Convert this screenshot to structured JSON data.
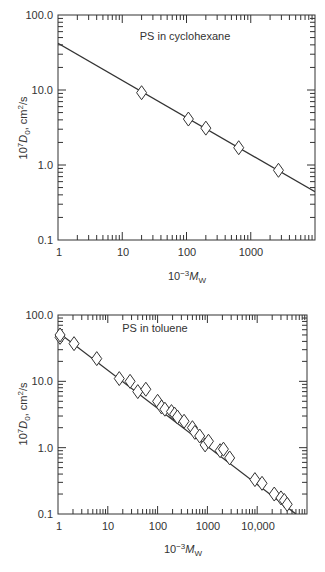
{
  "chart_data": [
    {
      "type": "scatter",
      "title": "PS in cyclohexane",
      "xlabel": "10^-3 M_W",
      "ylabel": "10^7 D_0, cm^2/s",
      "xscale": "log",
      "yscale": "log",
      "xlim": [
        1,
        10000
      ],
      "ylim": [
        0.1,
        100
      ],
      "x_ticks": [
        "1",
        "10",
        "100",
        "1000"
      ],
      "y_ticks": [
        "0.1",
        "1.0",
        "10.0",
        "100.0"
      ],
      "grid": false,
      "series": [
        {
          "name": "data",
          "marker": "diamond",
          "x": [
            20,
            107,
            200,
            650,
            2700
          ],
          "y": [
            9.2,
            4.1,
            3.1,
            1.7,
            0.85
          ]
        },
        {
          "name": "fit",
          "type": "line",
          "x": [
            1,
            10000
          ],
          "y": [
            42,
            0.44
          ]
        }
      ]
    },
    {
      "type": "scatter",
      "title": "PS in toluene",
      "xlabel": "10^-3 M_W",
      "ylabel": "10^7 D_0, cm^2/s",
      "xscale": "log",
      "yscale": "log",
      "xlim": [
        1,
        100000
      ],
      "ylim": [
        0.1,
        100
      ],
      "x_ticks": [
        "1",
        "10",
        "100",
        "1000",
        "10,000"
      ],
      "y_ticks": [
        "0.1",
        "1.0",
        "10.0",
        "100.0"
      ],
      "grid": false,
      "series": [
        {
          "name": "data",
          "marker": "diamond",
          "x": [
            1.1,
            1.1,
            2.1,
            6,
            17,
            28,
            40,
            58,
            100,
            120,
            140,
            190,
            220,
            250,
            340,
            500,
            560,
            700,
            900,
            1050,
            1800,
            2100,
            2800,
            9000,
            12500,
            22000,
            30000,
            35000,
            40000
          ],
          "y": [
            46,
            50,
            37,
            22,
            11,
            10,
            7,
            7.6,
            5,
            4.1,
            3.8,
            3.5,
            3.2,
            2.9,
            2.5,
            2.0,
            1.7,
            1.5,
            1.1,
            1.25,
            0.9,
            0.95,
            0.7,
            0.33,
            0.29,
            0.2,
            0.175,
            0.16,
            0.14
          ]
        },
        {
          "name": "fit",
          "type": "line",
          "x": [
            1,
            60000
          ],
          "y": [
            55,
            0.1
          ]
        }
      ]
    }
  ],
  "charts": {
    "top": {
      "title": "PS in cyclohexane",
      "y_tick_labels": [
        "100.0",
        "10.0",
        "1.0",
        "0.1"
      ],
      "x_tick_labels": [
        "1",
        "10",
        "100",
        "1000"
      ],
      "ylabel_prefix": "10",
      "ylabel_exp": "7",
      "ylabel_var": "D",
      "ylabel_sub": "0",
      "ylabel_unit": ", cm",
      "ylabel_unit_exp": "2",
      "ylabel_unit_tail": "/s",
      "xlabel_prefix": "10",
      "xlabel_exp": "−3",
      "xlabel_var": "M",
      "xlabel_sub": "W"
    },
    "bottom": {
      "title": "PS in toluene",
      "y_tick_labels": [
        "100.0",
        "10.0",
        "1.0",
        "0.1"
      ],
      "x_tick_labels": [
        "1",
        "10",
        "100",
        "1000",
        "10,000"
      ],
      "ylabel_prefix": "10",
      "ylabel_exp": "7",
      "ylabel_var": "D",
      "ylabel_sub": "0",
      "ylabel_unit": ", cm",
      "ylabel_unit_exp": "2",
      "ylabel_unit_tail": "/s",
      "xlabel_prefix": "10",
      "xlabel_exp": "−3",
      "xlabel_var": "M",
      "xlabel_sub": "W"
    }
  },
  "colors": {
    "axis": "#333333",
    "line": "#333333",
    "marker_fill": "#ffffff"
  }
}
